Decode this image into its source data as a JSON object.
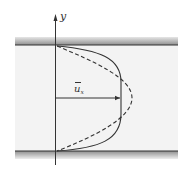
{
  "diagram": {
    "axis": {
      "label": "y"
    },
    "mean_velocity_label": {
      "symbol": "u",
      "subscript": "x",
      "overbar": true
    },
    "curves": [
      {
        "name": "solid-profile",
        "style": "solid",
        "description": "flat (turbulent-like) velocity profile"
      },
      {
        "name": "dashed-profile",
        "style": "dashed",
        "description": "parabolic (laminar-like) velocity profile"
      }
    ],
    "colors": {
      "background": "#ffffff",
      "channel_fill": "#f2f2f2",
      "wall_line": "#333333",
      "wall_shade": "#9a9a9a",
      "curve": "#333333"
    }
  }
}
